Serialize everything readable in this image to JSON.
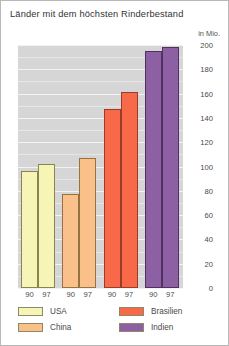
{
  "chart_data": {
    "type": "bar",
    "title": "Länder mit dem höchsten Rinderbestand",
    "unit_caption": "in Mio.",
    "xlabel": "",
    "ylabel": "in Mio.",
    "ylim": [
      0,
      200
    ],
    "ytick_step": 20,
    "yticks": [
      "200",
      "180",
      "160",
      "140",
      "120",
      "100",
      "80",
      "60",
      "40",
      "20",
      "0"
    ],
    "ytick_values": [
      200,
      180,
      160,
      140,
      120,
      100,
      80,
      60,
      40,
      20,
      0
    ],
    "grid": true,
    "legend_position": "bottom",
    "categories": [
      "USA",
      "China",
      "Brasilien",
      "Indien"
    ],
    "x": [
      "90",
      "97"
    ],
    "series": [
      {
        "name": "90",
        "values": [
          96,
          77,
          147,
          195
        ]
      },
      {
        "name": "97",
        "values": [
          102,
          107,
          161,
          198
        ]
      }
    ],
    "groups": [
      {
        "category": "USA",
        "color": "#f7f5b5",
        "border": "#8a8452",
        "bars": [
          {
            "year": "90",
            "value": 96
          },
          {
            "year": "97",
            "value": 102
          }
        ]
      },
      {
        "category": "China",
        "color": "#f9c08a",
        "border": "#97713f",
        "bars": [
          {
            "year": "90",
            "value": 77
          },
          {
            "year": "97",
            "value": 107
          }
        ]
      },
      {
        "category": "Brasilien",
        "color": "#f8694a",
        "border": "#9c3b28",
        "bars": [
          {
            "year": "90",
            "value": 147
          },
          {
            "year": "97",
            "value": 161
          }
        ]
      },
      {
        "category": "Indien",
        "color": "#8d5fa3",
        "border": "#4f3260",
        "bars": [
          {
            "year": "90",
            "value": 195
          },
          {
            "year": "97",
            "value": 198
          }
        ]
      }
    ],
    "legend": [
      {
        "label": "USA",
        "color": "#f7f5b5"
      },
      {
        "label": "China",
        "color": "#f9c08a"
      },
      {
        "label": "Brasilien",
        "color": "#f8694a"
      },
      {
        "label": "Indien",
        "color": "#8d5fa3"
      }
    ],
    "plot_background": "#d6d6d6",
    "gridline_color": "#f2f2f2"
  }
}
